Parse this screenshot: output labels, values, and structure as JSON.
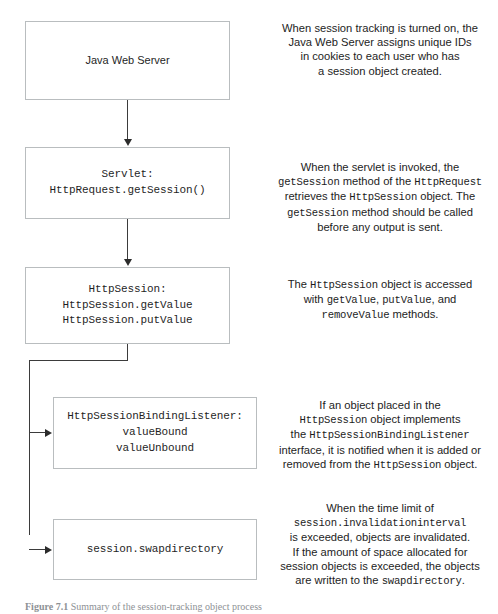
{
  "figure": {
    "caption_label": "Figure 7.1",
    "caption_text": "Summary of the session-tracking object process"
  },
  "nodes": [
    {
      "id": "server",
      "name": "java-web-server",
      "style": "sans",
      "lines": [
        "Java Web Server"
      ]
    },
    {
      "id": "servlet",
      "name": "servlet-getsession",
      "style": "mono",
      "lines": [
        "Servlet:",
        "HttpRequest.getSession()"
      ]
    },
    {
      "id": "session",
      "name": "httpsession",
      "style": "mono",
      "lines": [
        "HttpSession:",
        "HttpSession.getValue",
        "HttpSession.putValue"
      ]
    },
    {
      "id": "listener",
      "name": "httpsessionbindinglistener",
      "style": "mono",
      "lines": [
        "HttpSessionBindingListener:",
        "valueBound",
        "valueUnbound"
      ]
    },
    {
      "id": "swap",
      "name": "session-swapdirectory",
      "style": "mono",
      "lines": [
        "session.swapdirectory"
      ]
    }
  ],
  "notes": [
    {
      "id": "note-1",
      "name": "note-session-tracking",
      "segments": [
        {
          "text": "When session tracking is turned on, the",
          "code": false
        },
        {
          "text": " Java Web Server assigns unique IDs in cookies to each user who has a session object created.",
          "code": false
        }
      ],
      "plain": "When session tracking is turned on, the Java Web Server assigns unique IDs in cookies to each user who has a session object created."
    },
    {
      "id": "note-2",
      "name": "note-getsession",
      "plain": "When the servlet is invoked, the getSession method of the HttpRequest retrieves the HttpSession object. The getSession method should be called before any output is sent."
    },
    {
      "id": "note-3",
      "name": "note-httpsession-access",
      "plain": "The HttpSession object is accessed with getValue, putValue, and removeValue methods."
    },
    {
      "id": "note-4",
      "name": "note-binding-listener",
      "plain": "If an object placed in the HttpSession object implements the HttpSessionBindingListener interface, it is notified when it is added or removed from the HttpSession object."
    },
    {
      "id": "note-5",
      "name": "note-swapdirectory",
      "plain": "When the time limit of session.invalidationinterval is exceeded, objects are invalidated. If the amount of space allocated for session objects is exceeded, the objects are written to the swapdirectory."
    }
  ],
  "note_fragments": {
    "n1": {
      "l1": "When session tracking is turned on, the",
      "l2": "Java Web Server assigns unique IDs",
      "l3": "in cookies to each user who has",
      "l4": "a session object created."
    },
    "n2": {
      "l1a": "When the servlet is invoked, the",
      "l2a": "getSession",
      "l2b": " method of the ",
      "l2c": "HttpRequest",
      "l3a": "retrieves the ",
      "l3b": "HttpSession",
      "l3c": " object. The",
      "l4a": "getSession",
      "l4b": " method should be called",
      "l5a": "before any output is sent."
    },
    "n3": {
      "l1a": "The ",
      "l1b": "HttpSession",
      "l1c": " object is accessed",
      "l2a": "with ",
      "l2b": "getValue",
      "l2c": ", ",
      "l2d": "putValue",
      "l2e": ", and",
      "l3a": "removeValue",
      "l3b": " methods."
    },
    "n4": {
      "l1a": "If an object placed in the",
      "l2a": "HttpSession",
      "l2b": " object implements",
      "l3a": "the ",
      "l3b": "HttpSessionBindingListener",
      "l4a": "interface, it is notified when it is added or",
      "l5a": "removed from the ",
      "l5b": "HttpSession",
      "l5c": " object."
    },
    "n5": {
      "l1a": "When the time limit of",
      "l2a": "session.invalidationinterval",
      "l3a": "is exceeded, objects are invalidated.",
      "l4a": "If the amount of space allocated for",
      "l5a": "session objects is exceeded, the objects",
      "l6a": "are written to the ",
      "l6b": "swapdirectory",
      "l6c": "."
    }
  },
  "colors": {
    "box_border": "#b9bdbf",
    "connector": "#3b3b3b",
    "text": "#1d1d1d",
    "caption": "#8d9195",
    "background": "#ffffff"
  }
}
